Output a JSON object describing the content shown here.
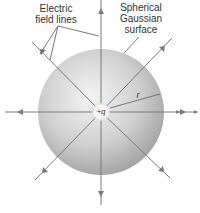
{
  "diagram": {
    "labels": {
      "field_lines": [
        "Electric",
        "field lines"
      ],
      "surface": [
        "Spherical",
        "Gaussian",
        "surface"
      ],
      "charge": "+q",
      "radius": "r"
    },
    "colors": {
      "line": "#7a7a7a",
      "sphere_light": "#f2f2f2",
      "sphere_dark": "#9c9c9c",
      "text": "#333333"
    }
  }
}
